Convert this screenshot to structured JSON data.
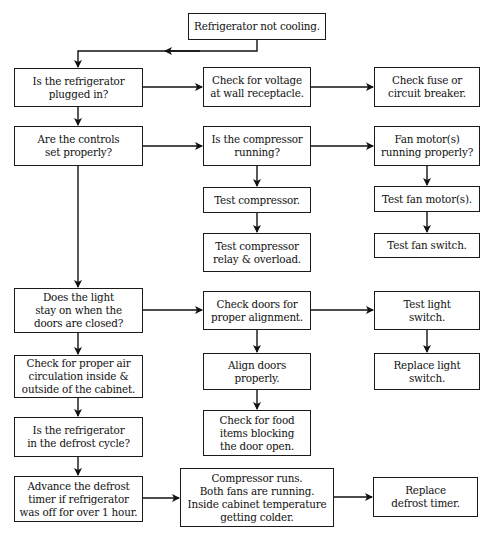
{
  "diagram": {
    "line_color": "#111111",
    "nodes": {
      "start": "Refrigerator not cooling.",
      "plugged_in": "Is the refrigerator\nplugged in?",
      "check_voltage": "Check for voltage\nat wall receptacle.",
      "check_fuse": "Check fuse or\ncircuit breaker.",
      "controls": "Are the controls\nset properly?",
      "compressor_running": "Is the compressor\nrunning?",
      "fan_motors": "Fan motor(s)\nrunning properly?",
      "test_compressor": "Test compressor.",
      "test_fan_motor": "Test fan motor(s).",
      "test_relay": "Test compressor\nrelay & overload.",
      "test_fan_switch": "Test fan switch.",
      "light_stays_on": "Does the light\nstay on when the\ndoors are closed?",
      "check_doors": "Check doors for\nproper alignment.",
      "test_light_switch": "Test light\nswitch.",
      "air_circulation": "Check for proper air\ncirculation inside &\noutside of the cabinet.",
      "align_doors": "Align doors\nproperly.",
      "replace_light_switch": "Replace light\nswitch.",
      "food_blocking": "Check for food\nitems blocking\nthe door open.",
      "defrost_cycle": "Is the refrigerator\nin the defrost cycle?",
      "advance_timer": "Advance the defrost\ntimer if refrigerator\nwas off for over 1 hour.",
      "compressor_runs": "Compressor runs.\nBoth fans are running.\nInside cabinet temperature\ngetting colder.",
      "replace_timer": "Replace\ndefrost timer."
    },
    "edges": [
      [
        "start",
        "plugged_in"
      ],
      [
        "plugged_in",
        "check_voltage"
      ],
      [
        "check_voltage",
        "check_fuse"
      ],
      [
        "plugged_in",
        "controls"
      ],
      [
        "controls",
        "compressor_running"
      ],
      [
        "compressor_running",
        "fan_motors"
      ],
      [
        "compressor_running",
        "test_compressor"
      ],
      [
        "test_compressor",
        "test_relay"
      ],
      [
        "fan_motors",
        "test_fan_motor"
      ],
      [
        "test_fan_motor",
        "test_fan_switch"
      ],
      [
        "controls",
        "light_stays_on"
      ],
      [
        "light_stays_on",
        "check_doors"
      ],
      [
        "check_doors",
        "test_light_switch"
      ],
      [
        "light_stays_on",
        "air_circulation"
      ],
      [
        "check_doors",
        "align_doors"
      ],
      [
        "align_doors",
        "food_blocking"
      ],
      [
        "test_light_switch",
        "replace_light_switch"
      ],
      [
        "air_circulation",
        "defrost_cycle"
      ],
      [
        "defrost_cycle",
        "advance_timer"
      ],
      [
        "advance_timer",
        "compressor_runs"
      ],
      [
        "compressor_runs",
        "replace_timer"
      ]
    ]
  }
}
